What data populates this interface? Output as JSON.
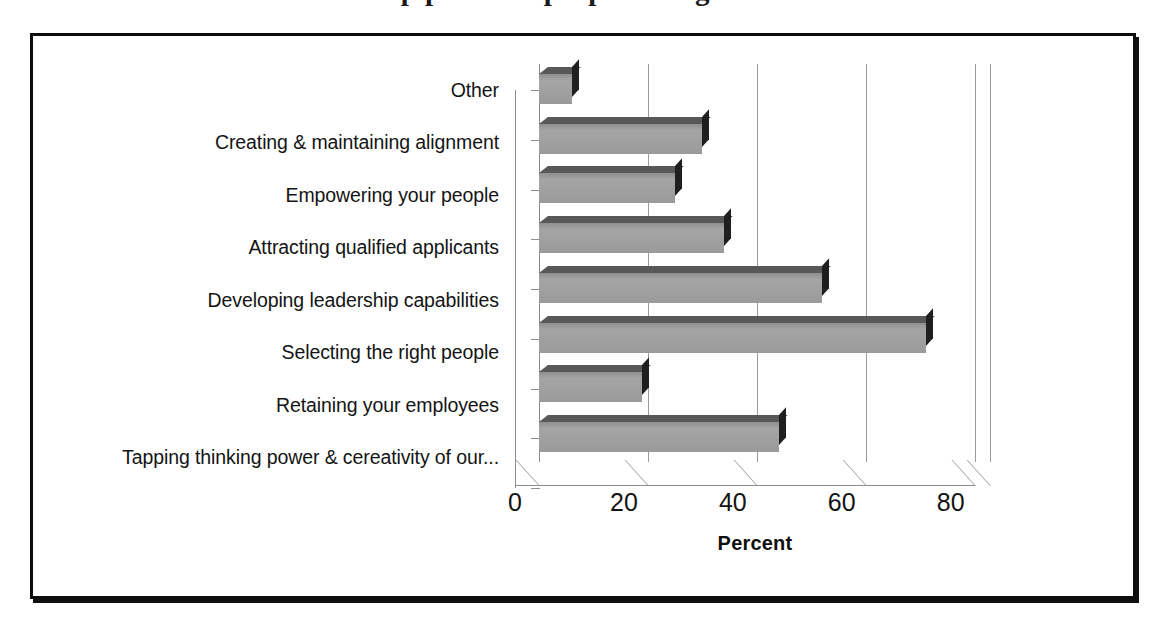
{
  "clipped_heading": "the top power & people of organizations",
  "axis_title_x": "Percent",
  "chart_data": {
    "type": "bar",
    "orientation": "horizontal",
    "title": "",
    "xlabel": "Percent",
    "ylabel": "",
    "xlim": [
      0,
      83
    ],
    "xticks": [
      0,
      20,
      40,
      60,
      80
    ],
    "grid": true,
    "legend": "none",
    "style": "3d-bar",
    "categories": [
      "Other",
      "Creating & maintaining alignment",
      "Empowering your people",
      "Attracting qualified applicants",
      "Developing leadership capabilities",
      "Selecting the right people",
      "Retaining your employees",
      "Tapping thinking power & cereativity of our..."
    ],
    "values": [
      6,
      30,
      25,
      34,
      52,
      71,
      19,
      44
    ],
    "colors": {
      "bar_face": "#9d9d9d",
      "bar_top": "#585858",
      "bar_side": "#1f1f1f",
      "gridline": "#9b9b9b",
      "frame": "#0d0d0d",
      "text": "#141414",
      "background": "#ffffff"
    }
  }
}
